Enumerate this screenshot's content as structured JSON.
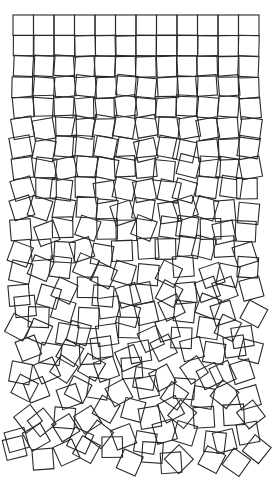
{
  "artwork": {
    "style": "gravel-of-squares",
    "background": "#ffffff",
    "stroke_color": "#2a2a2a",
    "stroke_width": 1.1,
    "grid": {
      "columns": 12,
      "rows": 22,
      "origin_x": 13,
      "origin_y": 15,
      "cell_size": 20.5
    },
    "disorder": {
      "max_rotation_deg": 45,
      "max_offset_px": 9,
      "seed": 7
    }
  }
}
